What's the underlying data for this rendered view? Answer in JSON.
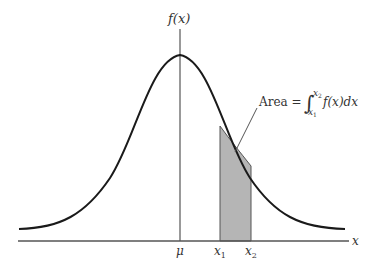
{
  "diagram": {
    "type": "normal-distribution-area",
    "y_axis_label": "f(x)",
    "x_axis_label": "x",
    "tick_labels": {
      "mu": "μ",
      "x1": "x",
      "x1_sub": "1",
      "x2": "x",
      "x2_sub": "2"
    },
    "annotation": {
      "prefix": "Area =",
      "integral_sign": "∫",
      "upper_limit": "x",
      "upper_limit_sub": "2",
      "lower_limit": "x",
      "lower_limit_sub": "1",
      "integrand": "f(x)dx"
    },
    "colors": {
      "curve": "#1a1a1a",
      "axis": "#555555",
      "shade": "#b5b5b5",
      "text": "#333333"
    }
  }
}
